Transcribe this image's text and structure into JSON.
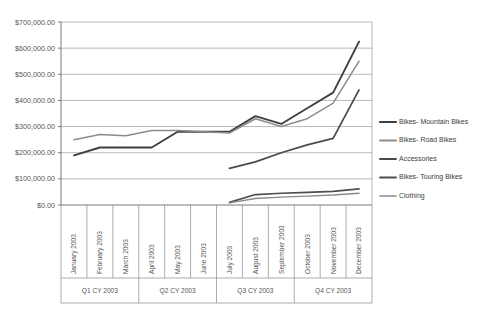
{
  "chart_data": {
    "type": "line",
    "title": "",
    "subtitle": "",
    "xlabel": "",
    "ylabel": "",
    "ylim": [
      0,
      700000
    ],
    "grid": true,
    "legend_position": "right",
    "y_ticks": [
      "$0.00",
      "$100,000.00",
      "$200,000.00",
      "$300,000.00",
      "$400,000.00",
      "$500,000.00",
      "$600,000.00",
      "$700,000.00"
    ],
    "y_tick_values": [
      0,
      100000,
      200000,
      300000,
      400000,
      500000,
      600000,
      700000
    ],
    "categories": [
      "January 2003",
      "February 2003",
      "March 2003",
      "April 2003",
      "May 2003",
      "June 2003",
      "July 2003",
      "August 2003",
      "September 2003",
      "October 2003",
      "November 2003",
      "December 2003"
    ],
    "category_groups": [
      {
        "label": "Q1 CY 2003",
        "members": [
          "January 2003",
          "February 2003",
          "March 2003"
        ]
      },
      {
        "label": "Q2 CY 2003",
        "members": [
          "April 2003",
          "May 2003",
          "June 2003"
        ]
      },
      {
        "label": "Q3 CY 2003",
        "members": [
          "July 2003",
          "August 2003",
          "September 2003"
        ]
      },
      {
        "label": "Q4 CY 2003",
        "members": [
          "October 2003",
          "November 2003",
          "December 2003"
        ]
      }
    ],
    "series": [
      {
        "name": "Bikes- Mountain Bikes",
        "color": "#3f3f3f",
        "width": 1.9,
        "values": [
          190000,
          220000,
          220000,
          220000,
          280000,
          280000,
          280000,
          340000,
          310000,
          370000,
          430000,
          625000
        ]
      },
      {
        "name": "Bikes- Road Bikes",
        "color": "#8c8c8c",
        "width": 1.5,
        "values": [
          250000,
          270000,
          265000,
          285000,
          285000,
          280000,
          275000,
          330000,
          300000,
          330000,
          390000,
          550000
        ]
      },
      {
        "name": "Accessories",
        "color": "#4a4a4a",
        "width": 1.7,
        "values": [
          null,
          null,
          null,
          null,
          null,
          null,
          140000,
          165000,
          200000,
          230000,
          255000,
          440000
        ]
      },
      {
        "name": "Bikes- Touring Bikes",
        "color": "#4f4f4f",
        "width": 1.7,
        "values": [
          null,
          null,
          null,
          null,
          null,
          null,
          10000,
          40000,
          45000,
          48000,
          52000,
          62000
        ]
      },
      {
        "name": "Clothing",
        "color": "#8a8a8a",
        "width": 1.4,
        "values": [
          null,
          null,
          null,
          null,
          null,
          null,
          8000,
          25000,
          30000,
          34000,
          38000,
          45000
        ]
      }
    ]
  },
  "legend": {
    "entries": [
      "Bikes- Mountain Bikes",
      "Bikes- Road Bikes",
      "Accessories",
      "Bikes- Touring Bikes",
      "Clothing"
    ]
  }
}
